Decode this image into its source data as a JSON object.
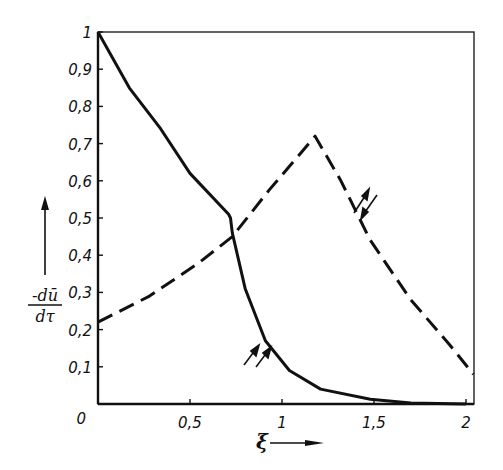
{
  "chart_data": {
    "type": "line",
    "title": "",
    "xlabel": "ξ",
    "ylabel": "-dū / dτ",
    "ylabel_numerator": "-dū",
    "ylabel_denominator": "dτ",
    "xlim": [
      0,
      2.05
    ],
    "ylim": [
      0,
      1
    ],
    "grid": false,
    "legend": "none (curves labelled inline by paired-arrow glyphs)",
    "x_ticks": [
      0,
      0.5,
      1,
      1.5,
      2
    ],
    "x_tick_labels": [
      "0",
      "0,5",
      "1",
      "1,5",
      "2"
    ],
    "y_ticks": [
      0,
      0.1,
      0.2,
      0.3,
      0.4,
      0.5,
      0.6,
      0.7,
      0.8,
      0.9,
      1
    ],
    "y_tick_labels": [
      "0",
      "0,1",
      "0,2",
      "0,3",
      "0,4",
      "0,5",
      "0,6",
      "0,7",
      "0,8",
      "0,9",
      "1"
    ],
    "series": [
      {
        "name": "parallel (solid)",
        "style": "solid",
        "annotation": "⇈ (parallel arrows)",
        "x": [
          0,
          0.17,
          0.34,
          0.5,
          0.71,
          0.72,
          0.73,
          0.8,
          0.91,
          1.04,
          1.21,
          1.48,
          1.7,
          2.0
        ],
        "y": [
          1.0,
          0.85,
          0.74,
          0.62,
          0.51,
          0.5,
          0.46,
          0.31,
          0.17,
          0.09,
          0.04,
          0.013,
          0.003,
          0.0
        ]
      },
      {
        "name": "antiparallel (dashed)",
        "style": "dashed",
        "annotation": "⇅ (opposed arrows)",
        "x": [
          0,
          0.28,
          0.55,
          0.73,
          0.93,
          1.18,
          1.32,
          1.48,
          1.7,
          1.91,
          2.04
        ],
        "y": [
          0.22,
          0.29,
          0.38,
          0.45,
          0.575,
          0.72,
          0.6,
          0.44,
          0.28,
          0.16,
          0.08
        ]
      }
    ]
  },
  "labels": {
    "x_axis_symbol": "ξ",
    "y_num": "-dū",
    "y_den": "dτ"
  },
  "colors": {
    "ink": "#111111",
    "background": "#ffffff"
  }
}
